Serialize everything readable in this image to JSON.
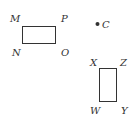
{
  "figure": {
    "rect1": {
      "labels": {
        "top_left": "M",
        "top_right": "P",
        "bottom_left": "N",
        "bottom_right": "O"
      },
      "stroke": "#333333"
    },
    "point": {
      "label": "C",
      "color": "#333333"
    },
    "rect2": {
      "labels": {
        "top_left": "X",
        "top_right": "Z",
        "bottom_left": "W",
        "bottom_right": "Y"
      },
      "stroke": "#333333"
    }
  }
}
